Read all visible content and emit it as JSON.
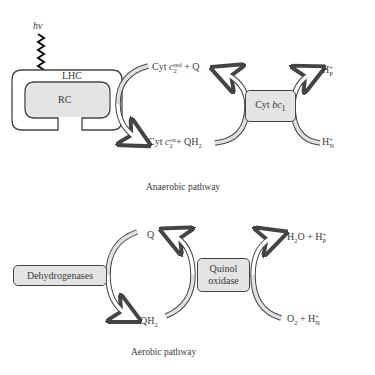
{
  "anaerobic": {
    "caption": "Anaerobic pathway",
    "light": "hν",
    "lhc_label": "LHC",
    "rc_label": "RC",
    "cytbc1": {
      "prefix": "Cyt ",
      "italic": "bc",
      "sub": "1"
    },
    "cytc2_red": {
      "prefix": "Cyt ",
      "italic": "c",
      "sub": "2",
      "sup": "red",
      "suffix": " + Q"
    },
    "cytc2_ox": {
      "prefix": "Cyt ",
      "italic": "c",
      "sub": "2",
      "sup": "ox",
      "suffix": "+ QH",
      "suffix_sub": "2"
    },
    "hp": {
      "text": "H",
      "sup": "+",
      "sub": "P"
    },
    "hn": {
      "text": "H",
      "sup": "+",
      "sub": "N"
    }
  },
  "aerobic": {
    "caption": "Aerobic pathway",
    "dehydrogenases": "Dehydrogenases",
    "quinol_oxidase_line1": "Quinol",
    "quinol_oxidase_line2": "oxidase",
    "q": "Q",
    "qh2": {
      "text": "QH",
      "sub": "2"
    },
    "h2o_hp": {
      "a": "H",
      "a_sub": "2",
      "b": "O + H",
      "b_sup": "+",
      "b_sub": "P"
    },
    "o2_hn": {
      "a": "O",
      "a_sub": "2",
      "b": " + H",
      "b_sup": "+",
      "b_sub": "N"
    }
  },
  "colors": {
    "box_fill": "#e4e4e4",
    "stroke": "#444444",
    "arrow_fill": "#e0e0e0"
  }
}
